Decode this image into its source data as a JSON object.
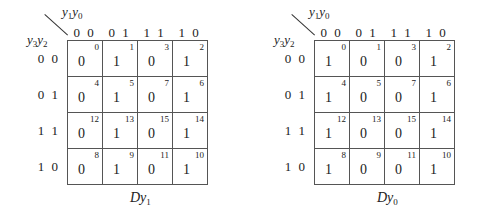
{
  "maps": [
    {
      "name": "Dy1",
      "caption": {
        "main": "Dy",
        "sub": "1"
      },
      "col_var": {
        "a": "y",
        "a_sub": "1",
        "b": "y",
        "b_sub": "0"
      },
      "row_var": {
        "a": "y",
        "a_sub": "3",
        "b": "y",
        "b_sub": "2"
      },
      "col_headers": [
        "0 0",
        "0 1",
        "1 1",
        "1 0"
      ],
      "row_headers": [
        "0 0",
        "0 1",
        "1 1",
        "1 0"
      ],
      "cells": [
        [
          {
            "idx": "0",
            "val": "0"
          },
          {
            "idx": "1",
            "val": "1"
          },
          {
            "idx": "3",
            "val": "0"
          },
          {
            "idx": "2",
            "val": "1"
          }
        ],
        [
          {
            "idx": "4",
            "val": "0"
          },
          {
            "idx": "5",
            "val": "1"
          },
          {
            "idx": "7",
            "val": "0"
          },
          {
            "idx": "6",
            "val": "1"
          }
        ],
        [
          {
            "idx": "12",
            "val": "0"
          },
          {
            "idx": "13",
            "val": "1"
          },
          {
            "idx": "15",
            "val": "0"
          },
          {
            "idx": "14",
            "val": "1"
          }
        ],
        [
          {
            "idx": "8",
            "val": "0"
          },
          {
            "idx": "9",
            "val": "1"
          },
          {
            "idx": "11",
            "val": "0"
          },
          {
            "idx": "10",
            "val": "1"
          }
        ]
      ]
    },
    {
      "name": "Dy0",
      "caption": {
        "main": "Dy",
        "sub": "0"
      },
      "col_var": {
        "a": "y",
        "a_sub": "1",
        "b": "y",
        "b_sub": "0"
      },
      "row_var": {
        "a": "y",
        "a_sub": "3",
        "b": "y",
        "b_sub": "2"
      },
      "col_headers": [
        "0 0",
        "0 1",
        "1 1",
        "1 0"
      ],
      "row_headers": [
        "0 0",
        "0 1",
        "1 1",
        "1 0"
      ],
      "cells": [
        [
          {
            "idx": "0",
            "val": "1"
          },
          {
            "idx": "1",
            "val": "0"
          },
          {
            "idx": "3",
            "val": "0"
          },
          {
            "idx": "2",
            "val": "1"
          }
        ],
        [
          {
            "idx": "4",
            "val": "1"
          },
          {
            "idx": "5",
            "val": "0"
          },
          {
            "idx": "7",
            "val": "0"
          },
          {
            "idx": "6",
            "val": "1"
          }
        ],
        [
          {
            "idx": "12",
            "val": "1"
          },
          {
            "idx": "13",
            "val": "0"
          },
          {
            "idx": "15",
            "val": "0"
          },
          {
            "idx": "14",
            "val": "1"
          }
        ],
        [
          {
            "idx": "8",
            "val": "1"
          },
          {
            "idx": "9",
            "val": "0"
          },
          {
            "idx": "11",
            "val": "0"
          },
          {
            "idx": "10",
            "val": "1"
          }
        ]
      ]
    }
  ]
}
